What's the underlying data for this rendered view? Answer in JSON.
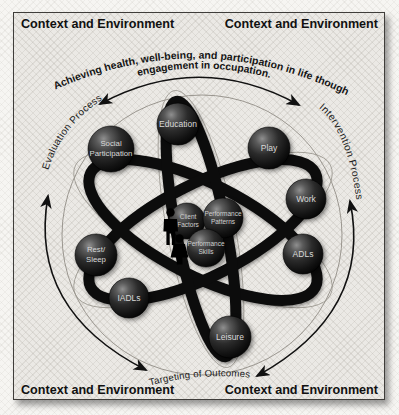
{
  "corner_label": "Context and Environment",
  "diagram_title_arc": {
    "line1": "Achieving health, well-being, and participation in life though",
    "line2": "engagement in occupation."
  },
  "process_arcs": {
    "left": "Evaluation Process",
    "right": "Intervention Process",
    "bottom": "Targeting of Outcomes"
  },
  "occupations": [
    {
      "name": "Education",
      "lines": [
        "Education"
      ]
    },
    {
      "name": "Play",
      "lines": [
        "Play"
      ]
    },
    {
      "name": "Work",
      "lines": [
        "Work"
      ]
    },
    {
      "name": "ADLs",
      "lines": [
        "ADLs"
      ]
    },
    {
      "name": "Leisure",
      "lines": [
        "Leisure"
      ]
    },
    {
      "name": "IADLs",
      "lines": [
        "IADLs"
      ]
    },
    {
      "name": "Rest/Sleep",
      "lines": [
        "Rest/",
        "Sleep"
      ]
    },
    {
      "name": "Social Participation",
      "lines": [
        "Social",
        "Participation"
      ]
    }
  ],
  "center_domains": [
    {
      "name": "Client Factors",
      "lines": [
        "Client",
        "Factors"
      ]
    },
    {
      "name": "Performance Patterns",
      "lines": [
        "Performance",
        "Patterns"
      ]
    },
    {
      "name": "Performance Skills",
      "lines": [
        "Performance",
        "Skills"
      ]
    }
  ],
  "icons": {
    "people": "man-and-woman-silhouette"
  },
  "colors": {
    "sphere": "#1d1d1d",
    "orbit": "#0c0c0c",
    "panel_bg": "#ebe9e5",
    "panel_border": "#3f3d3a",
    "text": "#111111",
    "sphere_label": "#d9d9d9"
  }
}
